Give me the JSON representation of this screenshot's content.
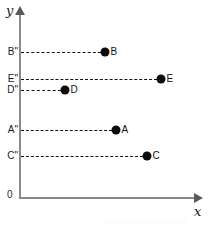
{
  "chart_data": {
    "type": "scatter",
    "title": "",
    "xlabel": "x",
    "ylabel": "y",
    "origin_label": "0",
    "grid": false,
    "legend": "none",
    "axis_color": "#8a8a8a",
    "point_color": "#0d0d0d",
    "guide_color": "#111111",
    "guide_style": "dashed",
    "xlim": [
      0,
      100
    ],
    "ylim": [
      0,
      100
    ],
    "x_tick_labels": [],
    "y_tick_labels": [
      "B\"",
      "E\"",
      "D\"",
      "A\"",
      "C\""
    ],
    "annotations": [
      "Each point is joined to the y-axis by a horizontal dashed guide line",
      "Point labels A–E sit immediately to the right of each dot"
    ],
    "points": [
      {
        "label": "B",
        "y_tick_label": "B\"",
        "x_px": 105,
        "y_px": 52,
        "x_value": 48.6,
        "y_value": 78.8
      },
      {
        "label": "E",
        "y_tick_label": "E\"",
        "x_px": 161,
        "y_px": 79,
        "x_value": 80.2,
        "y_value": 64.1
      },
      {
        "label": "D",
        "y_tick_label": "D\"",
        "x_px": 65,
        "y_px": 90,
        "x_value": 26.0,
        "y_value": 58.2
      },
      {
        "label": "A",
        "y_tick_label": "A\"",
        "x_px": 116,
        "y_px": 130,
        "x_value": 54.8,
        "y_value": 36.4
      },
      {
        "label": "C",
        "y_tick_label": "C\"",
        "x_px": 147,
        "y_px": 156,
        "x_value": 72.3,
        "y_value": 22.3
      }
    ]
  },
  "axes": {
    "y_name": "y",
    "x_name": "x",
    "origin": "0"
  }
}
